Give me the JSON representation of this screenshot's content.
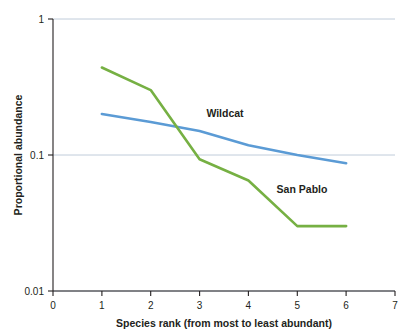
{
  "chart_data": {
    "type": "line",
    "title": "",
    "xlabel": "Species rank (from most to least abundant)",
    "ylabel": "Proportional abundance",
    "xlim": [
      0,
      7
    ],
    "ylim": [
      0.01,
      1
    ],
    "yscale": "log",
    "grid": "horizontal-major-only",
    "legend": "inline-labels",
    "x_ticks": [
      "0",
      "1",
      "2",
      "3",
      "4",
      "5",
      "6",
      "7"
    ],
    "y_ticks": [
      "1",
      "0.1",
      "0.01"
    ],
    "x": [
      1,
      2,
      3,
      4,
      5,
      6
    ],
    "series": [
      {
        "name": "Wildcat",
        "color": "#5b9bd5",
        "label": "Wildcat",
        "values": [
          0.2,
          0.175,
          0.15,
          0.118,
          0.1,
          0.087
        ]
      },
      {
        "name": "San Pablo",
        "color": "#76b043",
        "label": "San Pablo",
        "values": [
          0.44,
          0.3,
          0.093,
          0.065,
          0.03,
          0.03
        ]
      }
    ]
  },
  "labels": {
    "y_axis_title": "Proportional abundance",
    "x_axis_title": "Species rank (from most to least abundant)",
    "y_tick_1": "1",
    "y_tick_0_1": "0.1",
    "y_tick_0_01": "0.01",
    "x_tick_0": "0",
    "x_tick_1": "1",
    "x_tick_2": "2",
    "x_tick_3": "3",
    "x_tick_4": "4",
    "x_tick_5": "5",
    "x_tick_6": "6",
    "x_tick_7": "7",
    "series_wildcat": "Wildcat",
    "series_sanpablo": "San Pablo"
  }
}
